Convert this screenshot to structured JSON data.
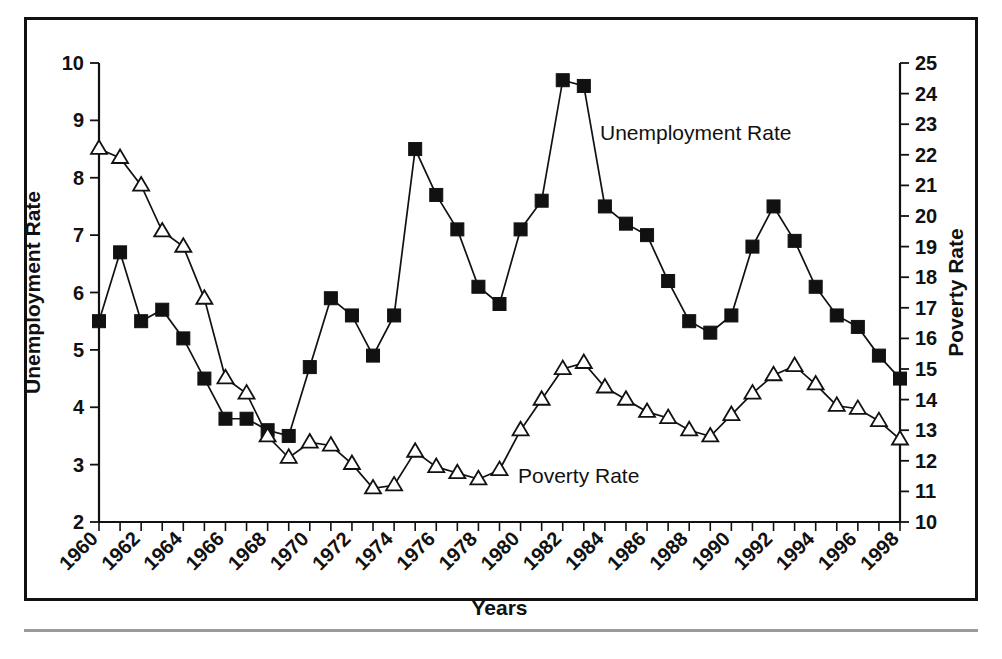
{
  "figure": {
    "frame": {
      "border_color": "#111111",
      "background": "#ffffff"
    },
    "annotations": [
      {
        "name": "unemployment-series-label",
        "text": "Unemployment Rate",
        "x": 600,
        "y": 140
      },
      {
        "name": "poverty-series-label",
        "text": "Poverty Rate",
        "x": 518,
        "y": 483
      }
    ]
  },
  "chart_data": {
    "type": "line",
    "title": "",
    "xlabel": "Years",
    "ylabel": "Unemployment Rate",
    "y2label": "Poverty Rate",
    "xlim": [
      1960,
      1998
    ],
    "ylim": [
      2,
      10
    ],
    "y2lim": [
      10,
      25
    ],
    "grid": false,
    "legend": "inline-annotations",
    "xticks_major": [
      1960,
      1962,
      1964,
      1966,
      1968,
      1970,
      1972,
      1974,
      1976,
      1978,
      1980,
      1982,
      1984,
      1986,
      1988,
      1990,
      1992,
      1994,
      1996,
      1998
    ],
    "xtick_labels": [
      "1960",
      "1962",
      "1964",
      "1966",
      "1968",
      "1970",
      "1972",
      "1974",
      "1976",
      "1978",
      "1980",
      "1982",
      "1984",
      "1986",
      "1988",
      "1990",
      "1992",
      "1994",
      "1996",
      "1998"
    ],
    "yticks": [
      2,
      3,
      4,
      5,
      6,
      7,
      8,
      9,
      10
    ],
    "ytick_labels": [
      "2",
      "3",
      "4",
      "5",
      "6",
      "7",
      "8",
      "9",
      "10"
    ],
    "y2ticks": [
      10,
      11,
      12,
      13,
      14,
      15,
      16,
      17,
      18,
      19,
      20,
      21,
      22,
      23,
      24,
      25
    ],
    "y2tick_labels": [
      "10",
      "11",
      "12",
      "13",
      "14",
      "15",
      "16",
      "17",
      "18",
      "19",
      "20",
      "21",
      "22",
      "23",
      "24",
      "25"
    ],
    "x": [
      1960,
      1961,
      1962,
      1963,
      1964,
      1965,
      1966,
      1967,
      1968,
      1969,
      1970,
      1971,
      1972,
      1973,
      1974,
      1975,
      1976,
      1977,
      1978,
      1979,
      1980,
      1981,
      1982,
      1983,
      1984,
      1985,
      1986,
      1987,
      1988,
      1989,
      1990,
      1991,
      1992,
      1993,
      1994,
      1995,
      1996,
      1997,
      1998
    ],
    "series": [
      {
        "name": "Unemployment Rate",
        "axis": "left",
        "marker": "filled-square",
        "values": [
          5.5,
          6.7,
          5.5,
          5.7,
          5.2,
          4.5,
          3.8,
          3.8,
          3.6,
          3.5,
          4.7,
          5.9,
          5.6,
          4.9,
          5.6,
          8.5,
          7.7,
          7.1,
          6.1,
          5.8,
          7.1,
          7.6,
          9.7,
          9.6,
          7.5,
          7.2,
          7.0,
          6.2,
          5.5,
          5.3,
          5.6,
          6.8,
          7.5,
          6.9,
          6.1,
          5.6,
          5.4,
          4.9,
          4.5
        ]
      },
      {
        "name": "Poverty Rate",
        "axis": "right",
        "marker": "open-triangle",
        "values": [
          22.2,
          21.9,
          21.0,
          19.5,
          19.0,
          17.3,
          14.7,
          14.2,
          12.8,
          12.1,
          12.6,
          12.5,
          11.9,
          11.1,
          11.2,
          12.3,
          11.8,
          11.6,
          11.4,
          11.7,
          13.0,
          14.0,
          15.0,
          15.2,
          14.4,
          14.0,
          13.6,
          13.4,
          13.0,
          12.8,
          13.5,
          14.2,
          14.8,
          15.1,
          14.5,
          13.8,
          13.7,
          13.3,
          12.7
        ]
      }
    ]
  }
}
